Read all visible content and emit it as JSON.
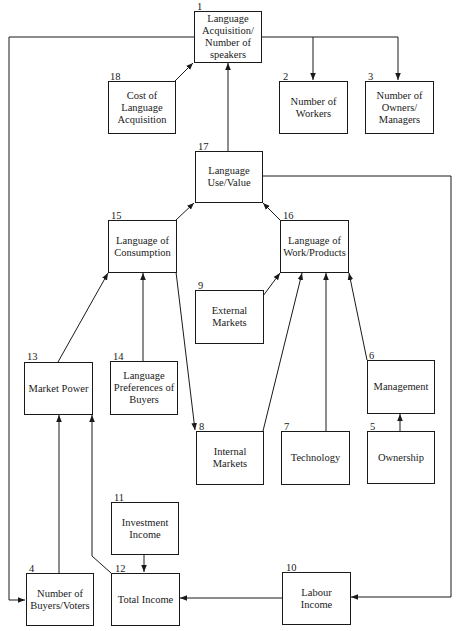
{
  "diagram": {
    "type": "flow-diagram",
    "nodes": [
      {
        "id": "1",
        "label": "Language Acquisition/ Number of speakers"
      },
      {
        "id": "2",
        "label": "Number of Workers"
      },
      {
        "id": "3",
        "label": "Number of Owners/ Managers"
      },
      {
        "id": "4",
        "label": "Number of Buyers/Voters"
      },
      {
        "id": "5",
        "label": "Ownership"
      },
      {
        "id": "6",
        "label": "Management"
      },
      {
        "id": "7",
        "label": "Technology"
      },
      {
        "id": "8",
        "label": "Internal Markets"
      },
      {
        "id": "9",
        "label": "External Markets"
      },
      {
        "id": "10",
        "label": "Labour Income"
      },
      {
        "id": "11",
        "label": "Investment Income"
      },
      {
        "id": "12",
        "label": "Total Income"
      },
      {
        "id": "13",
        "label": "Market Power"
      },
      {
        "id": "14",
        "label": "Language Preferences of Buyers"
      },
      {
        "id": "15",
        "label": "Language of Consumption"
      },
      {
        "id": "16",
        "label": "Language of Work/Products"
      },
      {
        "id": "17",
        "label": "Language Use/Value"
      },
      {
        "id": "18",
        "label": "Cost of Language Acquisition"
      }
    ],
    "edges": [
      {
        "from": "18",
        "to": "1"
      },
      {
        "from": "17",
        "to": "1"
      },
      {
        "from": "1",
        "to": "2"
      },
      {
        "from": "1",
        "to": "3"
      },
      {
        "from": "1",
        "to": "4"
      },
      {
        "from": "15",
        "to": "17"
      },
      {
        "from": "16",
        "to": "17"
      },
      {
        "from": "17",
        "to": "10"
      },
      {
        "from": "13",
        "to": "15"
      },
      {
        "from": "14",
        "to": "15"
      },
      {
        "from": "15",
        "to": "8"
      },
      {
        "from": "9",
        "to": "16"
      },
      {
        "from": "8",
        "to": "16"
      },
      {
        "from": "7",
        "to": "16"
      },
      {
        "from": "6",
        "to": "16"
      },
      {
        "from": "5",
        "to": "6"
      },
      {
        "from": "4",
        "to": "13"
      },
      {
        "from": "12",
        "to": "13"
      },
      {
        "from": "11",
        "to": "12"
      },
      {
        "from": "10",
        "to": "12"
      }
    ]
  }
}
